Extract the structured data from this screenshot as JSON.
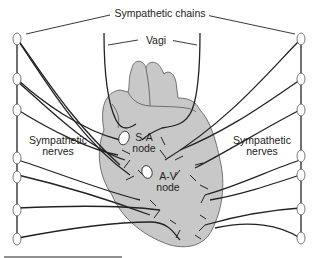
{
  "diagram": {
    "labels": {
      "sympathetic_chains": "Sympathetic chains",
      "vagi": "Vagi",
      "sympathetic_nerves_left_1": "Sympathetic",
      "sympathetic_nerves_left_2": "nerves",
      "sympathetic_nerves_right_1": "Sympathetic",
      "sympathetic_nerves_right_2": "nerves",
      "sa_node_1": "S-A",
      "sa_node_2": "node",
      "av_node_1": "A-V",
      "av_node_2": "node"
    },
    "colors": {
      "heart_fill": "#c8c8c8",
      "line": "#222222",
      "ganglion_fill": "#ffffff"
    }
  }
}
